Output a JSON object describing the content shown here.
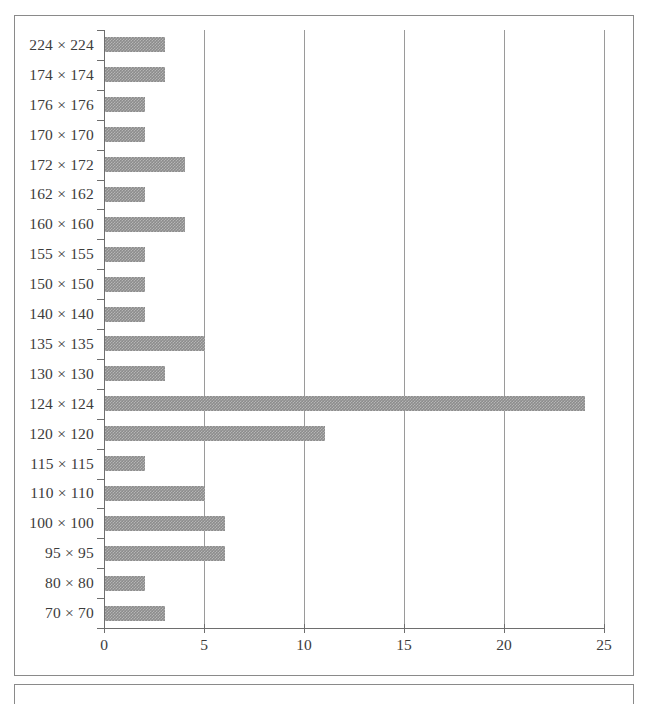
{
  "chart_data": {
    "type": "bar",
    "orientation": "horizontal",
    "title": "",
    "subtitle": "",
    "xlabel": "",
    "ylabel": "",
    "xlim": [
      0,
      25
    ],
    "ylim": null,
    "grid": "vertical",
    "legend": "none",
    "xticks": [
      0,
      5,
      10,
      15,
      20,
      25
    ],
    "xtick_labels": [
      "0",
      "5",
      "10",
      "15",
      "20",
      "25"
    ],
    "categories": [
      "224 × 224",
      "174 × 174",
      "176 × 176",
      "170 × 170",
      "172 × 172",
      "162 × 162",
      "160 × 160",
      "155 × 155",
      "150 × 150",
      "140 × 140",
      "135 × 135",
      "130 × 130",
      "124 × 124",
      "120 × 120",
      "115 × 115",
      "110 × 110",
      "100 × 100",
      "95 × 95",
      "80 × 80",
      "70 × 70"
    ],
    "values": [
      3,
      3,
      2,
      2,
      4,
      2,
      4,
      2,
      2,
      2,
      5,
      3,
      24,
      11,
      2,
      5,
      6,
      6,
      2,
      3
    ],
    "bar_color": "#8c8c8c",
    "axis_color": "#6e6e6e",
    "gridline_color": "#9a9a9a",
    "frame_color": "#8a8a8a",
    "text_color": "#3c3c3c"
  }
}
